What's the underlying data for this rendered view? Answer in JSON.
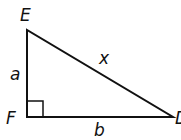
{
  "diagram": {
    "type": "right-triangle",
    "vertices": {
      "top": "E",
      "right_angle": "F",
      "right": "D"
    },
    "sides": {
      "vertical_leg": "a",
      "horizontal_leg": "b",
      "hypotenuse": "x"
    },
    "right_angle_marker_at": "F",
    "colors": {
      "stroke": "#111111",
      "background": "#ffffff"
    }
  }
}
